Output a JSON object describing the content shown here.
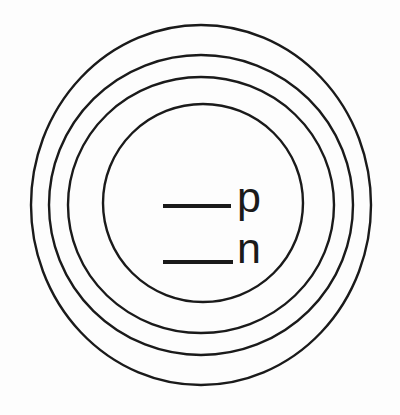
{
  "figure": {
    "name": "nuclear-shell-model-diagram",
    "background_color": "#fdfdfd",
    "stroke_color": "#1a1a1a",
    "width": 400,
    "height": 415
  },
  "shells": [
    {
      "name": "outer-shell",
      "cx": 201,
      "cy": 205,
      "rx": 170,
      "ry": 180,
      "stroke_width": 2.4
    },
    {
      "name": "second-shell",
      "cx": 201,
      "cy": 205,
      "rx": 152,
      "ry": 150,
      "stroke_width": 2.4
    },
    {
      "name": "third-shell",
      "cx": 201,
      "cy": 205,
      "rx": 133,
      "ry": 128,
      "stroke_width": 2.4
    },
    {
      "name": "inner-shell",
      "cx": 203,
      "cy": 203,
      "rx": 100,
      "ry": 99,
      "stroke_width": 2.4
    }
  ],
  "levels": [
    {
      "label": "p",
      "line": {
        "x1": 163,
        "x2": 231,
        "y": 206,
        "width": 4
      },
      "text": {
        "x": 237,
        "y": 212
      }
    },
    {
      "label": "n",
      "line": {
        "x1": 163,
        "x2": 233,
        "y": 262,
        "width": 4
      },
      "text": {
        "x": 237,
        "y": 263
      }
    }
  ]
}
